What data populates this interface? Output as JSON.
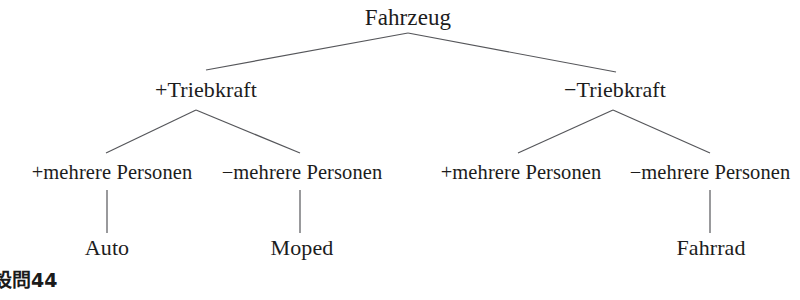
{
  "diagram": {
    "title_node": "Fahrzeug",
    "nodes": {
      "root": "Fahrzeug",
      "l1_left": "+Triebkraft",
      "l1_right": "−Triebkraft",
      "l2_a": "+mehrere Personen",
      "l2_b": "−mehrere Personen",
      "l2_c": "+mehrere Personen",
      "l2_d": "−mehrere Personen",
      "leaf_auto": "Auto",
      "leaf_moped": "Moped",
      "leaf_fahrrad": "Fahrrad"
    },
    "line_color": "#55565a",
    "text_color": "#1c1c1c",
    "background": "#ffffff"
  },
  "caption": {
    "label": "設問44"
  }
}
